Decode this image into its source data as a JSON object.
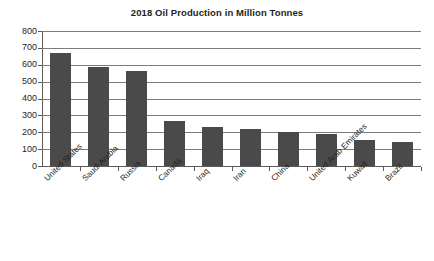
{
  "chart_data": {
    "type": "bar",
    "title": "2018 Oil Production in Million Tonnes",
    "xlabel": "",
    "ylabel": "",
    "ylim": [
      0,
      800
    ],
    "ytick_step": 100,
    "yticks": [
      "800",
      "700",
      "600",
      "500",
      "400",
      "300",
      "200",
      "100",
      "0"
    ],
    "grid": true,
    "legend": false,
    "categories": [
      "United States",
      "Saudi Arabia",
      "Russia",
      "Canada",
      "Iraq",
      "Iran",
      "China",
      "United Arab Emirates",
      "Kuwait",
      "Brazil"
    ],
    "values": [
      670,
      585,
      560,
      265,
      230,
      220,
      200,
      190,
      155,
      140
    ],
    "bar_color": "#4a4a4a",
    "grid_color": "#7c7c7c",
    "axis_color": "#5c5c5c",
    "background_color": "#ffffff"
  }
}
